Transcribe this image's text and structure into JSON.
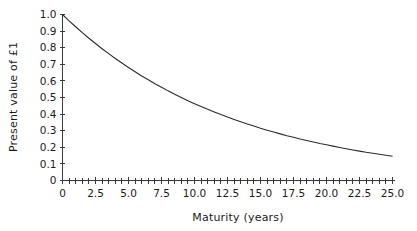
{
  "chart_data": {
    "type": "line",
    "title": "",
    "xlabel": "Maturity (years)",
    "ylabel": "Present value of £1",
    "xlim": [
      0,
      25
    ],
    "ylim": [
      0,
      1.0
    ],
    "grid": false,
    "legend": null,
    "x_tick_labels": [
      "0",
      "2.5",
      "5.0",
      "7.5",
      "10.0",
      "12.5",
      "15.0",
      "17.5",
      "20.0",
      "22.5",
      "25.0"
    ],
    "x_tick_values": [
      0,
      2.5,
      5.0,
      7.5,
      10.0,
      12.5,
      15.0,
      17.5,
      20.0,
      22.5,
      25.0
    ],
    "x_minor_step": 0.5,
    "y_tick_labels": [
      "0",
      "0.1",
      "0.2",
      "0.3",
      "0.4",
      "0.5",
      "0.6",
      "0.7",
      "0.8",
      "0.9",
      "1.0"
    ],
    "y_tick_values": [
      0,
      0.1,
      0.2,
      0.3,
      0.4,
      0.5,
      0.6,
      0.7,
      0.8,
      0.9,
      1.0
    ],
    "series": [
      {
        "name": "Present value of £1",
        "color": "#2b2b2b",
        "x": [
          0,
          0.5,
          1,
          1.5,
          2,
          2.5,
          3,
          3.5,
          4,
          4.5,
          5,
          5.5,
          6,
          6.5,
          7,
          7.5,
          8,
          8.5,
          9,
          9.5,
          10,
          10.5,
          11,
          11.5,
          12,
          12.5,
          13,
          13.5,
          14,
          14.5,
          15,
          15.5,
          16,
          16.5,
          17,
          17.5,
          18,
          18.5,
          19,
          19.5,
          20,
          20.5,
          21,
          21.5,
          22,
          22.5,
          23,
          23.5,
          24,
          24.5,
          25
        ],
        "values": [
          1.0,
          0.962,
          0.926,
          0.891,
          0.857,
          0.825,
          0.794,
          0.764,
          0.735,
          0.708,
          0.681,
          0.655,
          0.63,
          0.607,
          0.583,
          0.562,
          0.54,
          0.52,
          0.5,
          0.481,
          0.463,
          0.446,
          0.429,
          0.413,
          0.397,
          0.382,
          0.368,
          0.354,
          0.34,
          0.328,
          0.315,
          0.303,
          0.292,
          0.281,
          0.27,
          0.26,
          0.25,
          0.241,
          0.232,
          0.223,
          0.215,
          0.207,
          0.199,
          0.191,
          0.184,
          0.177,
          0.17,
          0.164,
          0.158,
          0.152,
          0.146
        ]
      }
    ]
  },
  "axes": {
    "x_title": "Maturity (years)",
    "y_title": "Present value of £1"
  }
}
